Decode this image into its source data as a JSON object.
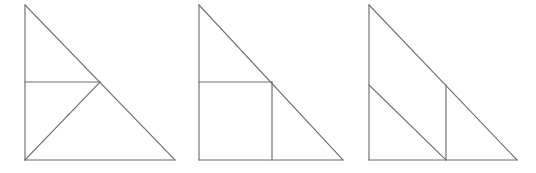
{
  "canvas": {
    "width": 536,
    "height": 173,
    "background_color": "#ffffff",
    "line_color": "#6e6e6e",
    "line_width": 1.15,
    "description": "Three right triangles drawn side by side, each subdivided by internal line segments"
  },
  "figures": [
    {
      "id": "figure-1",
      "name": "right-triangle-with-horizontal-and-diagonal",
      "label": "Figure 1",
      "description": "Right triangle with vertical leg on the left, horizontal leg on the bottom, hypotenuse from top-left to bottom-right. A horizontal segment at mid-height runs from the vertical leg to the hypotenuse, and a diagonal segment runs from the bottom-left corner to that same point on the hypotenuse.",
      "vertices": {
        "apex": [
          25,
          5
        ],
        "bottom_left": [
          25,
          160
        ],
        "bottom_right": [
          175,
          160
        ]
      },
      "segments": [
        {
          "name": "vertical-leg",
          "from": [
            25,
            5
          ],
          "to": [
            25,
            160
          ]
        },
        {
          "name": "bottom-leg",
          "from": [
            25,
            160
          ],
          "to": [
            175,
            160
          ]
        },
        {
          "name": "hypotenuse",
          "from": [
            25,
            5
          ],
          "to": [
            175,
            160
          ]
        },
        {
          "name": "inner-horizontal",
          "from": [
            25,
            82
          ],
          "to": [
            100,
            82
          ]
        },
        {
          "name": "inner-diagonal",
          "from": [
            25,
            160
          ],
          "to": [
            100,
            82
          ]
        }
      ]
    },
    {
      "id": "figure-2",
      "name": "right-triangle-with-inscribed-square",
      "label": "Figure 2",
      "description": "Right triangle with an inscribed square occupying the lower-left corner. The square's top-right vertex lies on the hypotenuse.",
      "vertices": {
        "apex": [
          199,
          5
        ],
        "bottom_left": [
          199,
          160
        ],
        "bottom_right": [
          343,
          160
        ]
      },
      "segments": [
        {
          "name": "vertical-leg",
          "from": [
            199,
            5
          ],
          "to": [
            199,
            160
          ]
        },
        {
          "name": "bottom-leg",
          "from": [
            199,
            160
          ],
          "to": [
            343,
            160
          ]
        },
        {
          "name": "hypotenuse",
          "from": [
            199,
            5
          ],
          "to": [
            343,
            160
          ]
        },
        {
          "name": "square-top-edge",
          "from": [
            199,
            82
          ],
          "to": [
            272,
            82
          ]
        },
        {
          "name": "square-right-edge",
          "from": [
            272,
            82
          ],
          "to": [
            272,
            160
          ]
        }
      ]
    },
    {
      "id": "figure-3",
      "name": "right-triangle-with-parallel-diagonal-and-vertical",
      "label": "Figure 3",
      "description": "Right triangle with an interior diagonal parallel to the hypotenuse running from the mid-point of the vertical leg to the base, and a vertical segment from that base point up to the hypotenuse.",
      "vertices": {
        "apex": [
          369,
          5
        ],
        "bottom_left": [
          369,
          160
        ],
        "bottom_right": [
          517,
          160
        ]
      },
      "segments": [
        {
          "name": "vertical-leg",
          "from": [
            369,
            5
          ],
          "to": [
            369,
            160
          ]
        },
        {
          "name": "bottom-leg",
          "from": [
            369,
            160
          ],
          "to": [
            517,
            160
          ]
        },
        {
          "name": "hypotenuse",
          "from": [
            369,
            5
          ],
          "to": [
            517,
            160
          ]
        },
        {
          "name": "inner-diagonal",
          "from": [
            369,
            85
          ],
          "to": [
            446,
            160
          ]
        },
        {
          "name": "inner-vertical",
          "from": [
            446,
            85
          ],
          "to": [
            446,
            160
          ]
        }
      ]
    }
  ]
}
